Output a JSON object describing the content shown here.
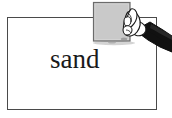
{
  "scene": {
    "width": 172,
    "height": 118,
    "background_color": "#ffffff",
    "description": "hand-holding-card-over-framed-word"
  },
  "frame": {
    "name": "word-frame",
    "border_color": "#4a4a4a",
    "fill_color": "#ffffff",
    "border_width_px": 1.5,
    "x": 7,
    "y": 17,
    "width": 150,
    "height": 93
  },
  "label": {
    "text": "sand",
    "color": "#1a1a1a",
    "font_size_px": 27,
    "x": 50,
    "y": 45
  },
  "card": {
    "name": "gray-card",
    "fill_color": "#c9c9c9",
    "border_color": "#6b6b6b",
    "x": 93,
    "y": 2,
    "width": 37,
    "height": 39
  },
  "hand": {
    "name": "hand-illustration",
    "skin_color": "#ffffff",
    "outline_color": "#1a1a1a",
    "sleeve_color": "#111111",
    "shadow_color": "#9a9a9a"
  }
}
